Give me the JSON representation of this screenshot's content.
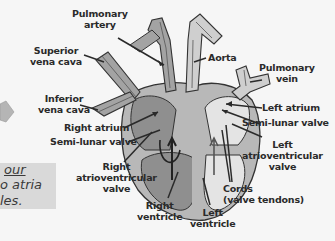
{
  "diagram": {
    "type": "heart-cross-section",
    "labels": {
      "pulmonary_artery": [
        "Pulmonary",
        "artery"
      ],
      "superior_vena_cava": [
        "Superior",
        "vena cava"
      ],
      "inferior_vena_cava": [
        "Inferior",
        "vena cava"
      ],
      "aorta": [
        "Aorta"
      ],
      "pulmonary_vein": [
        "Pulmonary",
        "vein"
      ],
      "left_atrium": [
        "Left atrium"
      ],
      "semi_lunar_valve_left": [
        "Semi-lunar valve"
      ],
      "right_atrium": [
        "Right atrium"
      ],
      "semi_lunar_valve_right": [
        "Semi-lunar valve"
      ],
      "left_av_valve": [
        "Left",
        "atrioventricular",
        "valve"
      ],
      "right_av_valve": [
        "Right",
        "atrioventricular",
        "valve"
      ],
      "cords": [
        "Cords",
        "(valve tendons)"
      ],
      "right_ventricle": [
        "Right",
        "ventricle"
      ],
      "left_ventricle": [
        "Left",
        "ventricle"
      ]
    },
    "note_fragment": {
      "line1": "our",
      "line2": "o atria",
      "line3": "les."
    },
    "colors": {
      "background": "#f6f6f6",
      "right_side_fill": "#8f8f8f",
      "left_side_fill": "#e4e4e4",
      "wall_fill": "#b8b8b8",
      "outline": "#333333",
      "note_box": "#d9d9d9",
      "arrow_gray": "#b5b5b5"
    }
  }
}
